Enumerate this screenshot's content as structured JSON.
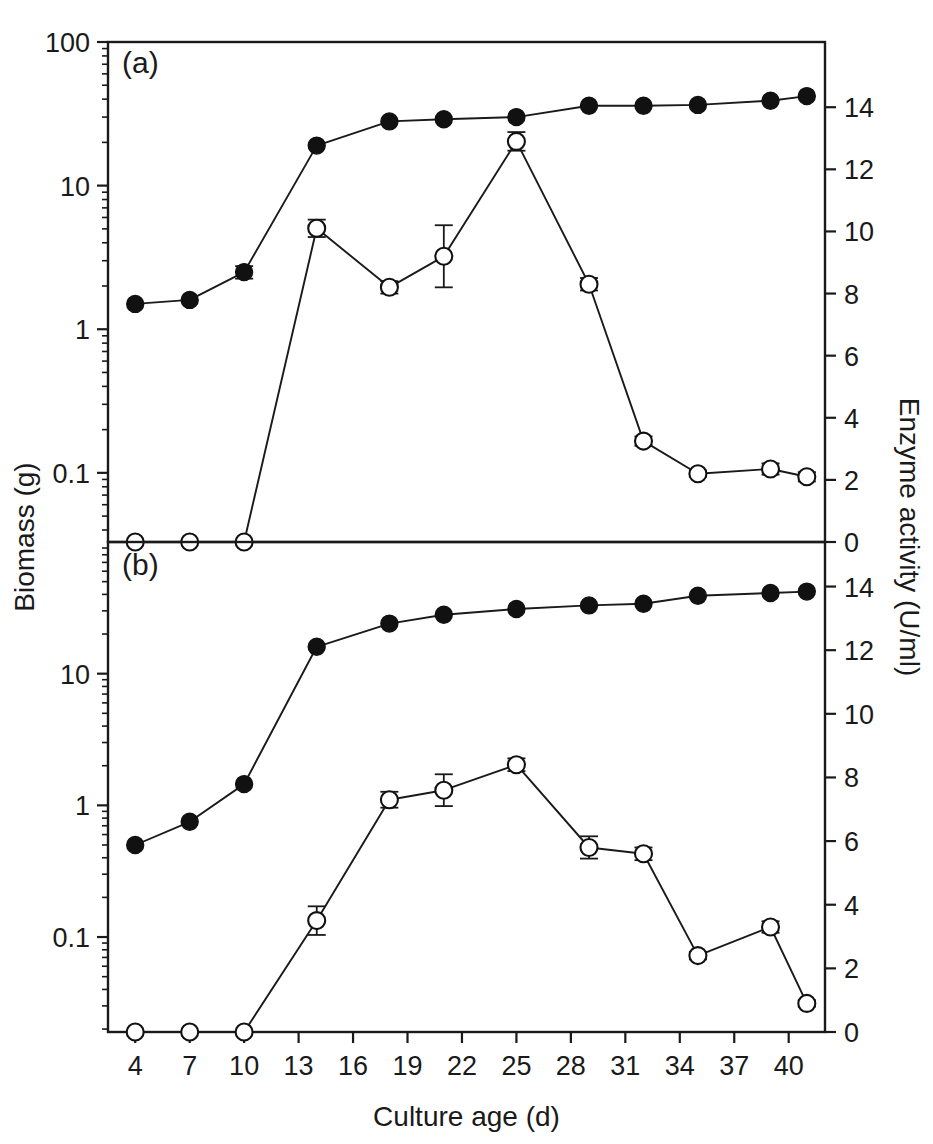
{
  "figure": {
    "panel_a_label": "(a)",
    "panel_b_label": "(b)",
    "xlabel": "Culture age (d)",
    "ylabel_left": "Biomass (g)",
    "ylabel_right": "Enzyme activity (U/ml)"
  },
  "chart_data": {
    "type": "line",
    "title": "",
    "xlabel": "Culture age (d)",
    "ylabel": "Biomass (g)",
    "ylabel_secondary": "Enzyme activity (U/ml)",
    "x_ticks": [
      4,
      7,
      10,
      13,
      16,
      19,
      22,
      25,
      28,
      31,
      34,
      37,
      40
    ],
    "x_tick_labels": [
      "4",
      "7",
      "10",
      "13",
      "16",
      "19",
      "22",
      "25",
      "28",
      "31",
      "34",
      "37",
      "40"
    ],
    "xlim": [
      2.5,
      42.0
    ],
    "grid": false,
    "legend": "none",
    "panels": [
      {
        "id": "a",
        "label": "(a)",
        "left_axis": {
          "scale": "log",
          "ticks": [
            0.1,
            1,
            10,
            100
          ],
          "tick_labels": [
            "0.1",
            "1",
            "10",
            "100"
          ],
          "ylim": [
            0.033,
            100
          ],
          "label": "Biomass (g)"
        },
        "right_axis": {
          "scale": "linear",
          "ticks": [
            0,
            2,
            4,
            6,
            8,
            10,
            12,
            14
          ],
          "tick_labels": [
            "0",
            "2",
            "4",
            "6",
            "8",
            "10",
            "12",
            "14"
          ],
          "ylim": [
            0,
            16.1
          ],
          "label": "Enzyme activity (U/ml)"
        },
        "series": [
          {
            "name": "Biomass",
            "marker": "filled-circle",
            "axis": "left",
            "x": [
              4,
              7,
              10,
              14,
              18,
              21,
              25,
              29,
              32,
              35,
              39,
              41
            ],
            "values": [
              1.5,
              1.6,
              2.5,
              19.0,
              28.0,
              29.0,
              30.0,
              36.0,
              36.0,
              36.5,
              39.0,
              42.0
            ],
            "errors": [
              0,
              0,
              0.25,
              0,
              0,
              0,
              0,
              0,
              0,
              0,
              0,
              0
            ]
          },
          {
            "name": "Enzyme activity",
            "marker": "open-circle",
            "axis": "right",
            "x": [
              4,
              7,
              10,
              14,
              18,
              21,
              25,
              29,
              32,
              35,
              39,
              41
            ],
            "values": [
              0.0,
              0.0,
              0.0,
              10.1,
              8.2,
              9.2,
              12.9,
              8.3,
              3.25,
              2.2,
              2.35,
              2.1
            ],
            "errors": [
              0,
              0,
              0,
              0.28,
              0.2,
              1.0,
              0.3,
              0.2,
              0.15,
              0.1,
              0.18,
              0.15
            ]
          }
        ]
      },
      {
        "id": "b",
        "label": "(b)",
        "left_axis": {
          "scale": "log",
          "ticks": [
            0.1,
            1,
            10
          ],
          "tick_labels": [
            "0.1",
            "1",
            "10"
          ],
          "ylim": [
            0.019,
            100
          ],
          "label": "Biomass (g)"
        },
        "right_axis": {
          "scale": "linear",
          "ticks": [
            0,
            2,
            4,
            6,
            8,
            10,
            12,
            14
          ],
          "tick_labels": [
            "0",
            "2",
            "4",
            "6",
            "8",
            "10",
            "12",
            "14"
          ],
          "ylim": [
            0,
            15.4
          ],
          "label": "Enzyme activity (U/ml)"
        },
        "series": [
          {
            "name": "Biomass",
            "marker": "filled-circle",
            "axis": "left",
            "x": [
              4,
              7,
              10,
              14,
              18,
              21,
              25,
              29,
              32,
              35,
              39,
              41
            ],
            "values": [
              0.5,
              0.75,
              1.45,
              16.0,
              24.0,
              28.0,
              31.0,
              33.0,
              34.0,
              39.0,
              41.0,
              42.0
            ],
            "errors": [
              0,
              0,
              0,
              0,
              0,
              0,
              0,
              0,
              0,
              0,
              0,
              0
            ]
          },
          {
            "name": "Enzyme activity",
            "marker": "open-circle",
            "axis": "right",
            "x": [
              4,
              7,
              10,
              14,
              18,
              21,
              25,
              29,
              32,
              35,
              39,
              41
            ],
            "values": [
              0.0,
              0.0,
              0.0,
              3.5,
              7.3,
              7.6,
              8.4,
              5.8,
              5.6,
              2.4,
              3.3,
              0.9
            ],
            "errors": [
              0,
              0,
              0,
              0.45,
              0.25,
              0.5,
              0.2,
              0.35,
              0.2,
              0.12,
              0.18,
              0.1
            ]
          }
        ]
      }
    ]
  }
}
